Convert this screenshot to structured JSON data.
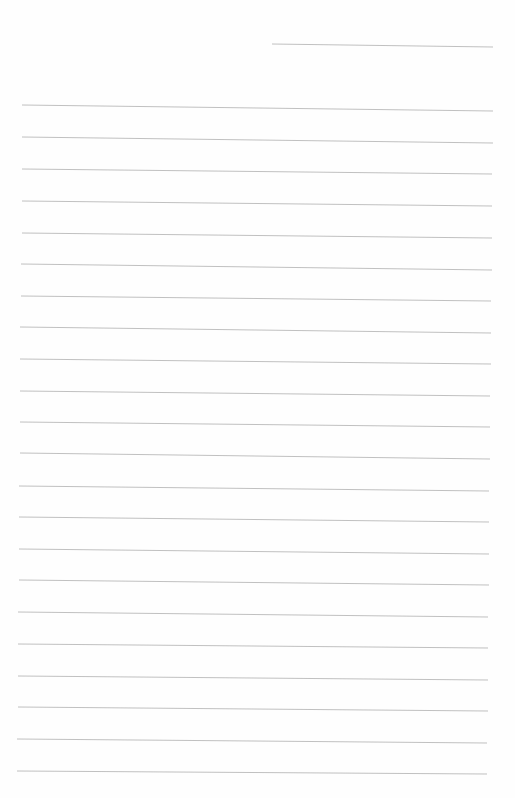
{
  "page": {
    "type": "lined-paper",
    "background_color": "#fefefe",
    "line_color": "#b9b9b9"
  },
  "header_line": {
    "x1": 272,
    "y1": 44,
    "x2": 493,
    "y2": 47
  },
  "ruled_lines": [
    {
      "x1": 22,
      "y1": 105,
      "x2": 493,
      "y2": 111
    },
    {
      "x1": 22,
      "y1": 137,
      "x2": 493,
      "y2": 143
    },
    {
      "x1": 22,
      "y1": 169,
      "x2": 492,
      "y2": 174
    },
    {
      "x1": 22,
      "y1": 201,
      "x2": 492,
      "y2": 206
    },
    {
      "x1": 22,
      "y1": 233,
      "x2": 492,
      "y2": 238
    },
    {
      "x1": 21,
      "y1": 264,
      "x2": 492,
      "y2": 270
    },
    {
      "x1": 21,
      "y1": 296,
      "x2": 491,
      "y2": 301
    },
    {
      "x1": 20,
      "y1": 327,
      "x2": 491,
      "y2": 333
    },
    {
      "x1": 20,
      "y1": 359,
      "x2": 491,
      "y2": 364
    },
    {
      "x1": 20,
      "y1": 391,
      "x2": 490,
      "y2": 396
    },
    {
      "x1": 20,
      "y1": 422,
      "x2": 490,
      "y2": 427
    },
    {
      "x1": 20,
      "y1": 453,
      "x2": 490,
      "y2": 459
    },
    {
      "x1": 19,
      "y1": 486,
      "x2": 489,
      "y2": 491
    },
    {
      "x1": 19,
      "y1": 517,
      "x2": 489,
      "y2": 522
    },
    {
      "x1": 19,
      "y1": 549,
      "x2": 489,
      "y2": 554
    },
    {
      "x1": 19,
      "y1": 580,
      "x2": 489,
      "y2": 585
    },
    {
      "x1": 18,
      "y1": 612,
      "x2": 488,
      "y2": 617
    },
    {
      "x1": 18,
      "y1": 644,
      "x2": 488,
      "y2": 648
    },
    {
      "x1": 18,
      "y1": 676,
      "x2": 488,
      "y2": 680
    },
    {
      "x1": 18,
      "y1": 707,
      "x2": 488,
      "y2": 711
    },
    {
      "x1": 17,
      "y1": 739,
      "x2": 487,
      "y2": 743
    },
    {
      "x1": 17,
      "y1": 771,
      "x2": 487,
      "y2": 774
    }
  ]
}
